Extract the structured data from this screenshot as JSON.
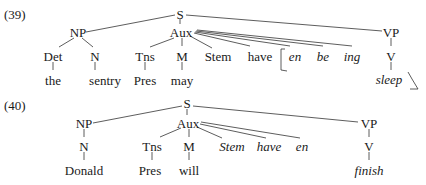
{
  "examples": [
    {
      "label": "(39)",
      "nodes": {
        "S": "S",
        "NP": "NP",
        "Aux": "Aux",
        "VP": "VP",
        "Det": "Det",
        "N": "N",
        "Tns": "Tns",
        "M": "M",
        "Stem": "Stem",
        "have": "have",
        "en": "en",
        "be": "be",
        "ing": "ing",
        "V": "V",
        "the": "the",
        "sentry": "sentry",
        "Pres": "Pres",
        "may": "may",
        "sleep": "sleep"
      },
      "italic_nodes": [
        "en",
        "be",
        "ing",
        "sleep"
      ],
      "bracket_note": "en ... sleep bracketed (affix hopping)"
    },
    {
      "label": "(40)",
      "nodes": {
        "S": "S",
        "NP": "NP",
        "Aux": "Aux",
        "VP": "VP",
        "N": "N",
        "Tns": "Tns",
        "M": "M",
        "Stem": "Stem",
        "have": "have",
        "en": "en",
        "V": "V",
        "Donald": "Donald",
        "Pres": "Pres",
        "will": "will",
        "finish": "finish"
      },
      "italic_nodes": [
        "Stem",
        "have",
        "en",
        "finish"
      ]
    }
  ]
}
